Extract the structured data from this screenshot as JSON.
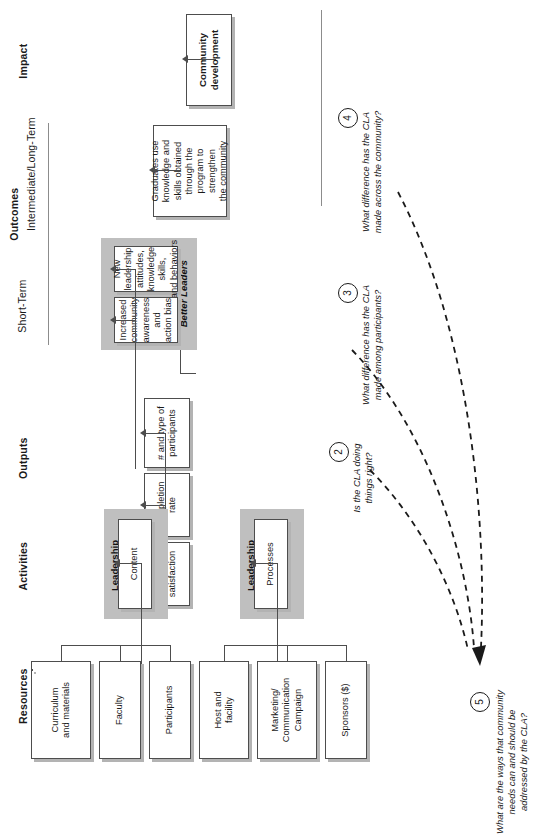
{
  "diagram": {
    "orientation": "rotated-90-ccw",
    "colors": {
      "panel_fill": "#bfbfbf",
      "box_fill": "#ffffff",
      "line": "#4d4d4d",
      "shadow": "#b3b3b3",
      "text": "#1a1a1a"
    }
  },
  "columns": {
    "resources": "Resources",
    "activities": "Activities",
    "outputs": "Outputs",
    "outcomes_group": "Outcomes",
    "outcomes_short": "Short-Term",
    "outcomes_long": "Intermediate/Long-Term",
    "impact": "Impact"
  },
  "resources": [
    {
      "label": "Curriculum\nand materials"
    },
    {
      "label": "Faculty"
    },
    {
      "label": "Participants"
    },
    {
      "label": "Host and\nfacility"
    },
    {
      "label": "Marketing/\nCommunication\nCampaign"
    },
    {
      "label": "Sponsors ($)"
    }
  ],
  "activities": [
    {
      "box": "Content",
      "panel": "Leadership\nCurriculum"
    },
    {
      "box": "Processes",
      "panel": "Leadership\nExperiences"
    }
  ],
  "outputs": [
    {
      "label": "# and type of\nparticipants"
    },
    {
      "label": "Completion\nrate"
    },
    {
      "label": "Participant\nsatisfaction"
    }
  ],
  "short_term": {
    "panel": "Better Leaders",
    "boxes": [
      {
        "label": "New leadership\nattitudes,\nknowledge skills,\nand behaviors"
      },
      {
        "label": "Increased\ncommunity\nawareness and\naction bias"
      }
    ]
  },
  "long_term": {
    "label": "Graduates use\nknowledge and\nskills obtained\nthrough the\nprogram to\nstrengthen\nthe community"
  },
  "impact": {
    "label": "Community\ndevelopment"
  },
  "questions": [
    {
      "number": "2",
      "text": "Is the CLA doing\nthings right?"
    },
    {
      "number": "3",
      "text": "What difference has the CLA\nmade among participants?"
    },
    {
      "number": "4",
      "text": "What difference has the CLA\nmade across the community?"
    },
    {
      "number": "5",
      "text": "What are the ways that community\nneeds can and should be\naddressed by the CLA?"
    }
  ]
}
